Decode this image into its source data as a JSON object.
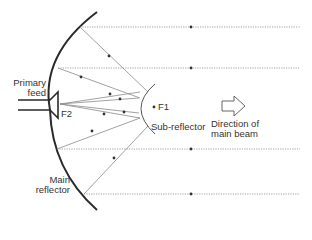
{
  "diagram": {
    "type": "cassegrain-antenna",
    "labels": {
      "primary_feed": "Primary\nfeed",
      "primary_feed_line1": "Primary",
      "primary_feed_line2": "feed",
      "f2": "F2",
      "f1": "F1",
      "sub_reflector": "Sub-reflector",
      "direction_line1": "Direction of",
      "direction_line2": "main beam",
      "main_reflector_line1": "Main",
      "main_reflector_line2": "reflector"
    },
    "colors": {
      "reflector": "#2a2a2a",
      "ray": "#8a8a8a",
      "dotted_ray": "#8a8a8a",
      "text": "#333333",
      "background": "#ffffff"
    },
    "parallel_rays_y": [
      27,
      68,
      149,
      194
    ]
  }
}
